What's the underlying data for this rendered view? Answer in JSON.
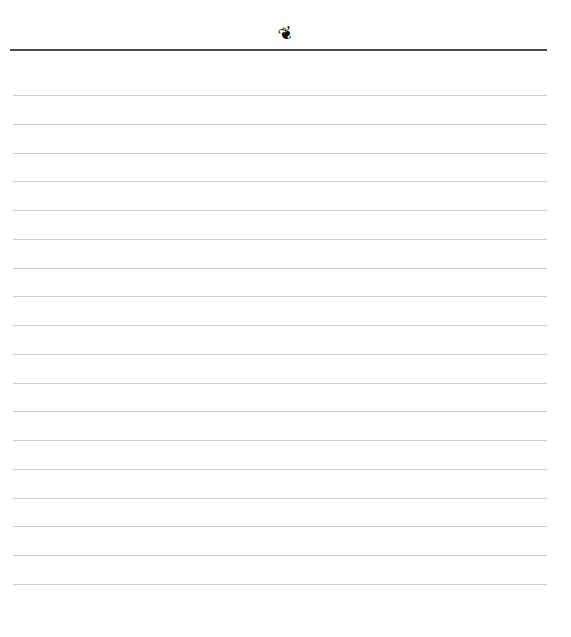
{
  "page": {
    "ornament": {
      "glyph": "❦",
      "icon": "floral-heart-icon"
    },
    "header_rule_color": "#4a4a4a",
    "line_color": "#cfcfcf",
    "lines": {
      "count": 18,
      "first_y": 95,
      "spacing": 28.76
    }
  }
}
